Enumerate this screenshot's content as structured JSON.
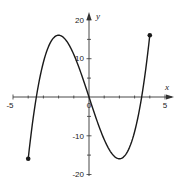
{
  "chart_data": {
    "type": "line",
    "title": "",
    "function": "f(x) = x^3 - 12x",
    "xlabel": "x",
    "ylabel": "y",
    "xlim": [
      -5,
      5
    ],
    "ylim": [
      -20,
      20
    ],
    "grid": false,
    "x_tick_labels": [
      "-5",
      "0",
      "5"
    ],
    "y_tick_labels": [
      "20",
      "10",
      "-10",
      "-20"
    ],
    "domain": [
      -4,
      4
    ],
    "endpoints": [
      {
        "x": -4,
        "y": -16,
        "filled": true
      },
      {
        "x": 4,
        "y": 16,
        "filled": true
      }
    ],
    "key_points": [
      {
        "label": "local max",
        "x": -2,
        "y": 16
      },
      {
        "label": "local min",
        "x": 2,
        "y": -16
      },
      {
        "label": "root",
        "x": -3.46,
        "y": 0
      },
      {
        "label": "root",
        "x": 0,
        "y": 0
      },
      {
        "label": "root",
        "x": 3.46,
        "y": 0
      }
    ],
    "series": [
      {
        "name": "f(x)",
        "x": [
          -4,
          -3.5,
          -3,
          -2.5,
          -2,
          -1.5,
          -1,
          -0.5,
          0,
          0.5,
          1,
          1.5,
          2,
          2.5,
          3,
          3.5,
          4
        ],
        "y": [
          -16,
          -0.875,
          9,
          14.375,
          16,
          14.625,
          11,
          5.875,
          0,
          -5.875,
          -11,
          -14.625,
          -16,
          -14.375,
          -9,
          0.875,
          16
        ]
      }
    ]
  },
  "axes": {
    "x_name": "x",
    "y_name": "y",
    "labels": {
      "x_neg5": "-5",
      "x_zero": "0",
      "x_pos5": "5",
      "y_20": "20",
      "y_10": "10",
      "y_neg10": "-10",
      "y_neg20": "-20"
    }
  },
  "colors": {
    "curve": "#1a1a1a",
    "axis": "#333333",
    "background": "#ffffff"
  }
}
